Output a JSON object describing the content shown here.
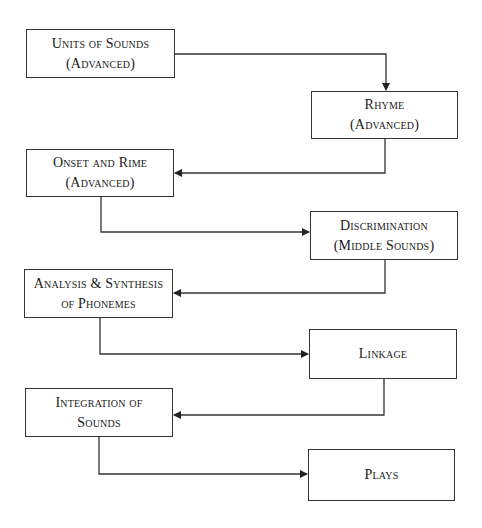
{
  "diagram": {
    "type": "flowchart",
    "nodes": [
      {
        "id": "units-of-sounds",
        "lines": [
          "Units of Sounds",
          "(Advanced)"
        ]
      },
      {
        "id": "rhyme",
        "lines": [
          "Rhyme",
          "(Advanced)"
        ]
      },
      {
        "id": "onset-and-rime",
        "lines": [
          "Onset and Rime",
          "(Advanced)"
        ]
      },
      {
        "id": "discrimination",
        "lines": [
          "Discrimination",
          "(Middle Sounds)"
        ]
      },
      {
        "id": "analysis-synthesis",
        "lines": [
          "Analysis & Synthesis",
          "of Phonemes"
        ]
      },
      {
        "id": "linkage",
        "lines": [
          "Linkage"
        ]
      },
      {
        "id": "integration",
        "lines": [
          "Integration of",
          "Sounds"
        ]
      },
      {
        "id": "plays",
        "lines": [
          "Plays"
        ]
      }
    ],
    "edges": [
      {
        "from": "units-of-sounds",
        "to": "rhyme"
      },
      {
        "from": "rhyme",
        "to": "onset-and-rime"
      },
      {
        "from": "onset-and-rime",
        "to": "discrimination"
      },
      {
        "from": "discrimination",
        "to": "analysis-synthesis"
      },
      {
        "from": "analysis-synthesis",
        "to": "linkage"
      },
      {
        "from": "linkage",
        "to": "integration"
      },
      {
        "from": "integration",
        "to": "plays"
      }
    ],
    "colors": {
      "line": "#333333",
      "text": "#1a1a1a",
      "background": "#ffffff"
    }
  }
}
